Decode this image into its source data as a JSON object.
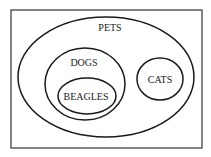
{
  "diagram": {
    "type": "venn-euler",
    "frame": {
      "x": 11,
      "y": 10,
      "w": 191,
      "h": 138
    },
    "sets": [
      {
        "id": "pets",
        "label": "PETS",
        "cx": 106,
        "cy": 77,
        "rx": 88,
        "ry": 60,
        "label_x": 110,
        "label_y": 31
      },
      {
        "id": "dogs",
        "label": "DOGS",
        "cx": 85,
        "cy": 84,
        "rx": 40,
        "ry": 36,
        "label_x": 84,
        "label_y": 66
      },
      {
        "id": "beagles",
        "label": "BEAGLES",
        "cx": 87,
        "cy": 96,
        "rx": 29,
        "ry": 18,
        "label_x": 86,
        "label_y": 100
      },
      {
        "id": "cats",
        "label": "CATS",
        "cx": 160,
        "cy": 79,
        "rx": 23,
        "ry": 21,
        "label_x": 160,
        "label_y": 83
      }
    ],
    "stroke_color": "#1a1a1a",
    "frame_color": "#333333"
  }
}
